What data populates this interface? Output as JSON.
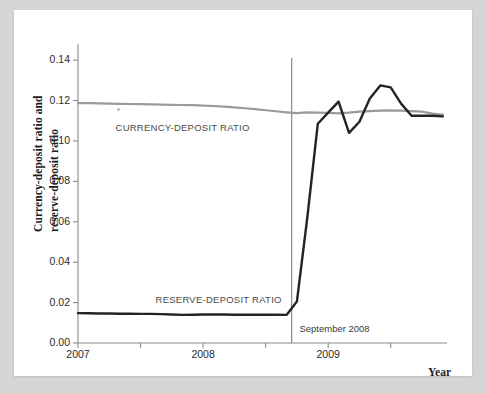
{
  "figure": {
    "background_color": "#d5d5d3",
    "sheet_color": "#ffffff"
  },
  "chart_data": {
    "type": "line",
    "title": "",
    "subtitle": "",
    "xlabel": "Year",
    "ylabel": "Currency-deposit ratio and reserve-deposit ratio",
    "ylabel_line1": "Currency-deposit ratio and",
    "ylabel_line2": "reserve-deposit ratio",
    "xlim": [
      2007.0,
      2009.95
    ],
    "ylim": [
      0.0,
      0.148
    ],
    "grid": false,
    "legend_position": "inline-annotations",
    "y_ticks": [
      0.0,
      0.02,
      0.04,
      0.06,
      0.08,
      0.1,
      0.12,
      0.14
    ],
    "y_tick_labels": [
      "0.00",
      "0.02",
      "0.04",
      "0.06",
      "0.08",
      "0.10",
      "0.12",
      "0.14"
    ],
    "x_ticks": [
      2007.0,
      2007.5,
      2008.0,
      2008.5,
      2009.0,
      2009.5
    ],
    "x_tick_labels": [
      "2007",
      "",
      "2008",
      "",
      "2009",
      ""
    ],
    "x_major_labels": [
      {
        "value": 2007.0,
        "label": "2007"
      },
      {
        "value": 2008.0,
        "label": "2008"
      },
      {
        "value": 2009.0,
        "label": "2009"
      }
    ],
    "annotations": [
      {
        "name": "september-2008-marker",
        "label": "September 2008",
        "x": 2008.708,
        "type": "vline",
        "color": "#8a8a8a",
        "label_x": 2008.77,
        "label_y": 0.0065
      }
    ],
    "series": [
      {
        "name": "CURRENCY-DEPOSIT RATIO",
        "label": "CURRENCY-DEPOSIT RATIO",
        "color": "#9a9a9a",
        "width": 2.2,
        "label_x": 2007.3,
        "label_y": 0.1065,
        "x": [
          2007.0,
          2007.083,
          2007.167,
          2007.25,
          2007.333,
          2007.417,
          2007.5,
          2007.583,
          2007.667,
          2007.75,
          2007.833,
          2007.917,
          2008.0,
          2008.083,
          2008.167,
          2008.25,
          2008.333,
          2008.417,
          2008.5,
          2008.583,
          2008.667,
          2008.75,
          2008.833,
          2008.917,
          2009.0,
          2009.083,
          2009.167,
          2009.25,
          2009.333,
          2009.417,
          2009.5,
          2009.583,
          2009.667,
          2009.75,
          2009.833,
          2009.917
        ],
        "y": [
          0.1187,
          0.1187,
          0.1186,
          0.1185,
          0.1184,
          0.1183,
          0.1182,
          0.1181,
          0.118,
          0.1179,
          0.1178,
          0.1177,
          0.1175,
          0.1173,
          0.117,
          0.1166,
          0.1162,
          0.1158,
          0.1152,
          0.1147,
          0.1142,
          0.1138,
          0.1142,
          0.114,
          0.1139,
          0.1137,
          0.114,
          0.1145,
          0.1148,
          0.115,
          0.1151,
          0.115,
          0.1148,
          0.1145,
          0.1135,
          0.113
        ]
      },
      {
        "name": "RESERVE-DEPOSIT RATIO",
        "label": "RESERVE-DEPOSIT RATIO",
        "color": "#242424",
        "width": 2.4,
        "label_x": 2007.62,
        "label_y": 0.0215,
        "x": [
          2007.0,
          2007.083,
          2007.167,
          2007.25,
          2007.333,
          2007.417,
          2007.5,
          2007.583,
          2007.667,
          2007.75,
          2007.833,
          2007.917,
          2008.0,
          2008.083,
          2008.167,
          2008.25,
          2008.333,
          2008.417,
          2008.5,
          2008.583,
          2008.667,
          2008.75,
          2008.833,
          2008.917,
          2009.0,
          2009.083,
          2009.167,
          2009.25,
          2009.333,
          2009.417,
          2009.5,
          2009.583,
          2009.667,
          2009.75,
          2009.833,
          2009.917
        ],
        "y": [
          0.0148,
          0.0147,
          0.0146,
          0.0146,
          0.0145,
          0.0145,
          0.0144,
          0.0144,
          0.0143,
          0.0141,
          0.0139,
          0.014,
          0.0141,
          0.0141,
          0.0141,
          0.014,
          0.014,
          0.014,
          0.014,
          0.014,
          0.0139,
          0.0205,
          0.062,
          0.1085,
          0.114,
          0.1195,
          0.104,
          0.1095,
          0.121,
          0.1275,
          0.1265,
          0.1185,
          0.1125,
          0.1125,
          0.1125,
          0.1122
        ]
      }
    ],
    "axis_color": "#8a8a8a",
    "tick_color": "#8a8a8a"
  },
  "axes_labels": {
    "year": "Year"
  }
}
